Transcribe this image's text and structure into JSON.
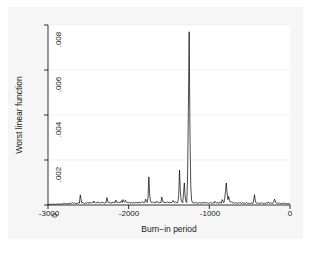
{
  "chart_data": {
    "type": "line",
    "title": "",
    "xlabel": "Burn−in period",
    "ylabel": "Worst linear function",
    "xlim": [
      -3000,
      0
    ],
    "ylim": [
      0,
      0.008
    ],
    "xticks": [
      -3000,
      -2000,
      -1000,
      0
    ],
    "xtick_labels": [
      "-3000",
      "-2000",
      "-1000",
      "0"
    ],
    "yticks": [
      0,
      0.002,
      0.004,
      0.006,
      0.008
    ],
    "ytick_labels": [
      "0",
      ".002",
      ".004",
      ".006",
      ".008"
    ],
    "grid": true,
    "grid_axis": "y",
    "legend": "none",
    "line_color": "#000000",
    "line_width": 0.7,
    "background_color": "#f6f6f6",
    "plot_background_color": "#ffffff",
    "series": [
      {
        "name": "Worst linear function",
        "x": [
          -3000,
          -2990,
          -2980,
          -2970,
          -2960,
          -2950,
          -2940,
          -2930,
          -2920,
          -2910,
          -2900,
          -2890,
          -2880,
          -2870,
          -2860,
          -2850,
          -2840,
          -2830,
          -2820,
          -2810,
          -2800,
          -2790,
          -2780,
          -2770,
          -2760,
          -2750,
          -2740,
          -2730,
          -2720,
          -2710,
          -2700,
          -2690,
          -2680,
          -2670,
          -2660,
          -2650,
          -2640,
          -2630,
          -2620,
          -2610,
          -2600,
          -2590,
          -2580,
          -2570,
          -2560,
          -2550,
          -2540,
          -2530,
          -2520,
          -2510,
          -2500,
          -2490,
          -2480,
          -2470,
          -2460,
          -2450,
          -2440,
          -2430,
          -2420,
          -2410,
          -2400,
          -2390,
          -2380,
          -2370,
          -2360,
          -2350,
          -2340,
          -2330,
          -2320,
          -2310,
          -2300,
          -2290,
          -2280,
          -2270,
          -2260,
          -2250,
          -2240,
          -2230,
          -2220,
          -2210,
          -2200,
          -2190,
          -2180,
          -2170,
          -2160,
          -2150,
          -2140,
          -2130,
          -2120,
          -2110,
          -2100,
          -2090,
          -2080,
          -2070,
          -2060,
          -2050,
          -2040,
          -2030,
          -2020,
          -2010,
          -2000,
          -1990,
          -1980,
          -1970,
          -1960,
          -1950,
          -1940,
          -1930,
          -1920,
          -1910,
          -1900,
          -1890,
          -1880,
          -1870,
          -1860,
          -1850,
          -1840,
          -1830,
          -1820,
          -1810,
          -1800,
          -1790,
          -1780,
          -1770,
          -1760,
          -1750,
          -1740,
          -1730,
          -1720,
          -1710,
          -1700,
          -1690,
          -1680,
          -1670,
          -1660,
          -1650,
          -1640,
          -1630,
          -1620,
          -1610,
          -1600,
          -1590,
          -1580,
          -1570,
          -1560,
          -1550,
          -1540,
          -1530,
          -1520,
          -1510,
          -1500,
          -1490,
          -1480,
          -1470,
          -1460,
          -1450,
          -1440,
          -1430,
          -1420,
          -1410,
          -1400,
          -1390,
          -1380,
          -1370,
          -1360,
          -1350,
          -1340,
          -1330,
          -1320,
          -1310,
          -1300,
          -1290,
          -1280,
          -1270,
          -1260,
          -1250,
          -1240,
          -1230,
          -1220,
          -1210,
          -1200,
          -1190,
          -1180,
          -1170,
          -1160,
          -1150,
          -1140,
          -1130,
          -1120,
          -1110,
          -1100,
          -1090,
          -1080,
          -1070,
          -1060,
          -1050,
          -1040,
          -1030,
          -1020,
          -1010,
          -1000,
          -990,
          -980,
          -970,
          -960,
          -950,
          -940,
          -930,
          -920,
          -910,
          -900,
          -890,
          -880,
          -870,
          -860,
          -850,
          -840,
          -830,
          -820,
          -810,
          -800,
          -790,
          -780,
          -770,
          -760,
          -750,
          -740,
          -730,
          -720,
          -710,
          -700,
          -690,
          -680,
          -670,
          -660,
          -650,
          -640,
          -630,
          -620,
          -610,
          -600,
          -590,
          -580,
          -570,
          -560,
          -550,
          -540,
          -530,
          -520,
          -510,
          -500,
          -490,
          -480,
          -470,
          -460,
          -450,
          -440,
          -430,
          -420,
          -410,
          -400,
          -390,
          -380,
          -370,
          -360,
          -350,
          -340,
          -330,
          -320,
          -310,
          -300,
          -290,
          -280,
          -270,
          -260,
          -250,
          -240,
          -230,
          -220,
          -210,
          -200,
          -190,
          -180,
          -170,
          -160,
          -150,
          -140,
          -130,
          -120,
          -110,
          -100,
          -90,
          -80,
          -70,
          -60,
          -50,
          -40,
          -30,
          -20,
          -10,
          0
        ],
        "values": [
          2e-05,
          3e-05,
          2e-05,
          4e-05,
          3e-05,
          2e-05,
          3e-05,
          5e-05,
          3e-05,
          2e-05,
          4e-05,
          3e-05,
          6e-05,
          4e-05,
          3e-05,
          5e-05,
          4e-05,
          3e-05,
          6e-05,
          5e-05,
          8e-05,
          6e-05,
          4e-05,
          7e-05,
          5e-05,
          4e-05,
          9e-05,
          6e-05,
          5e-05,
          7e-05,
          0.00012,
          8e-05,
          6e-05,
          0.0001,
          7e-05,
          5e-05,
          9e-05,
          7e-05,
          0.00011,
          8e-05,
          0.00045,
          0.00025,
          9e-05,
          0.00012,
          8e-05,
          6e-05,
          0.0001,
          9e-05,
          7e-05,
          0.00011,
          9e-05,
          7e-05,
          0.00013,
          0.0001,
          8e-05,
          0.00012,
          9e-05,
          0.00018,
          0.00012,
          8e-05,
          0.00011,
          9e-05,
          0.00014,
          0.00011,
          8e-05,
          0.0001,
          0.00013,
          9e-05,
          0.00012,
          0.0001,
          8e-05,
          0.00011,
          9e-05,
          0.00033,
          0.00018,
          0.0001,
          0.00012,
          9e-05,
          0.00011,
          8e-05,
          0.00014,
          0.0001,
          0.00012,
          9e-05,
          0.00022,
          0.00013,
          0.0001,
          0.00015,
          0.00011,
          9e-05,
          0.00013,
          0.00019,
          0.00011,
          0.00024,
          0.00016,
          0.00012,
          0.00021,
          0.00014,
          0.0001,
          0.00012,
          9e-05,
          0.00013,
          0.0001,
          8e-05,
          0.00012,
          9e-05,
          0.00011,
          8e-05,
          0.0001,
          0.00013,
          9e-05,
          0.00011,
          8e-05,
          0.00014,
          0.0001,
          9e-05,
          0.00012,
          0.00016,
          0.00011,
          9e-05,
          0.00013,
          0.00026,
          0.00015,
          0.00011,
          0.00032,
          0.00125,
          0.00048,
          0.00018,
          0.00012,
          0.0001,
          0.00014,
          0.00011,
          9e-05,
          0.00013,
          0.0001,
          0.00017,
          0.00012,
          9e-05,
          0.00011,
          0.00014,
          0.0001,
          0.00035,
          0.00022,
          0.00012,
          0.0001,
          0.00013,
          9e-05,
          0.00011,
          0.00015,
          0.0001,
          0.00012,
          9e-05,
          0.00014,
          0.0001,
          0.00012,
          0.0002,
          0.00013,
          0.0001,
          0.00015,
          0.00011,
          9e-05,
          0.00013,
          0.00042,
          0.00155,
          0.00068,
          0.00022,
          0.00013,
          0.0001,
          0.00052,
          0.00098,
          0.00036,
          0.00014,
          0.00011,
          0.0012,
          0.0042,
          0.0077,
          0.0031,
          0.00085,
          0.00022,
          0.00012,
          9e-05,
          0.00011,
          8e-05,
          0.00012,
          9e-05,
          7e-05,
          0.0001,
          8e-05,
          0.00011,
          9e-05,
          7e-05,
          0.00012,
          9e-05,
          8e-05,
          0.00014,
          0.0001,
          8e-05,
          0.00011,
          9e-05,
          7e-05,
          0.0001,
          8e-05,
          0.00012,
          9e-05,
          7e-05,
          0.00011,
          8e-05,
          0.00016,
          0.00011,
          8e-05,
          0.00012,
          9e-05,
          7e-05,
          0.00013,
          0.0001,
          8e-05,
          0.00024,
          0.00015,
          0.0001,
          0.00029,
          0.0006,
          0.00098,
          0.00052,
          0.00024,
          0.00038,
          0.0002,
          0.00013,
          0.00016,
          0.00011,
          9e-05,
          0.00012,
          9e-05,
          8e-05,
          0.00011,
          9e-05,
          7e-05,
          0.0001,
          8e-05,
          0.00012,
          9e-05,
          7e-05,
          0.0001,
          8e-05,
          6e-05,
          9e-05,
          7e-05,
          0.00011,
          8e-05,
          6e-05,
          9e-05,
          7e-05,
          6e-05,
          0.0001,
          8e-05,
          6e-05,
          0.00022,
          0.00046,
          0.00018,
          9e-05,
          7e-05,
          0.0001,
          8e-05,
          6e-05,
          9e-05,
          7e-05,
          0.00011,
          8e-05,
          6e-05,
          9e-05,
          7e-05,
          6e-05,
          0.0001,
          8e-05,
          0.00014,
          9e-05,
          7e-05,
          0.00011,
          8e-05,
          6e-05,
          9e-05,
          0.00018,
          0.00026,
          0.00013,
          8e-05,
          0.0001,
          7e-05,
          6e-05,
          9e-05,
          7e-05,
          5e-05,
          8e-05,
          6e-05,
          9e-05,
          7e-05,
          5e-05,
          8e-05,
          6e-05,
          5e-05,
          7e-05,
          5e-05,
          4e-05
        ]
      }
    ]
  },
  "axes": {
    "y_title": "Worst linear function",
    "x_title": "Burn−in period",
    "x_tick_labels": [
      "-3000",
      "-2000",
      "-1000",
      "0"
    ],
    "y_tick_labels": [
      ".008",
      ".006",
      ".004",
      ".002",
      "0"
    ]
  }
}
